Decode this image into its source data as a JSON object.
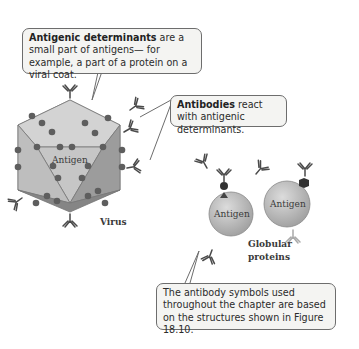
{
  "callouts": {
    "determinants": {
      "bold": "Antigenic determinants",
      "rest": " are a small part of antigens— for example, a part of a protein on a viral coat."
    },
    "antibodies": {
      "bold": "Antibodies",
      "rest": " react with antigenic determinants."
    },
    "symbols": {
      "text": "The antibody symbols used throughout the chapter are based on the structures shown in Figure 18.10."
    }
  },
  "labels": {
    "virus": "Virus",
    "globular": "Globular",
    "proteins": "proteins",
    "antigen_virus": "Antigen",
    "antigen_sphere_1": "Antigen",
    "antigen_sphere_2": "Antigen"
  },
  "colors": {
    "face_light": "#c9c9c9",
    "face_mid": "#b3b3b3",
    "face_dark": "#8f8f8f",
    "determinant": "#5e5e5e",
    "antibody": "#4a4a4a",
    "antibody_light": "#a9a9a9",
    "sphere": "#b9b9b9"
  }
}
